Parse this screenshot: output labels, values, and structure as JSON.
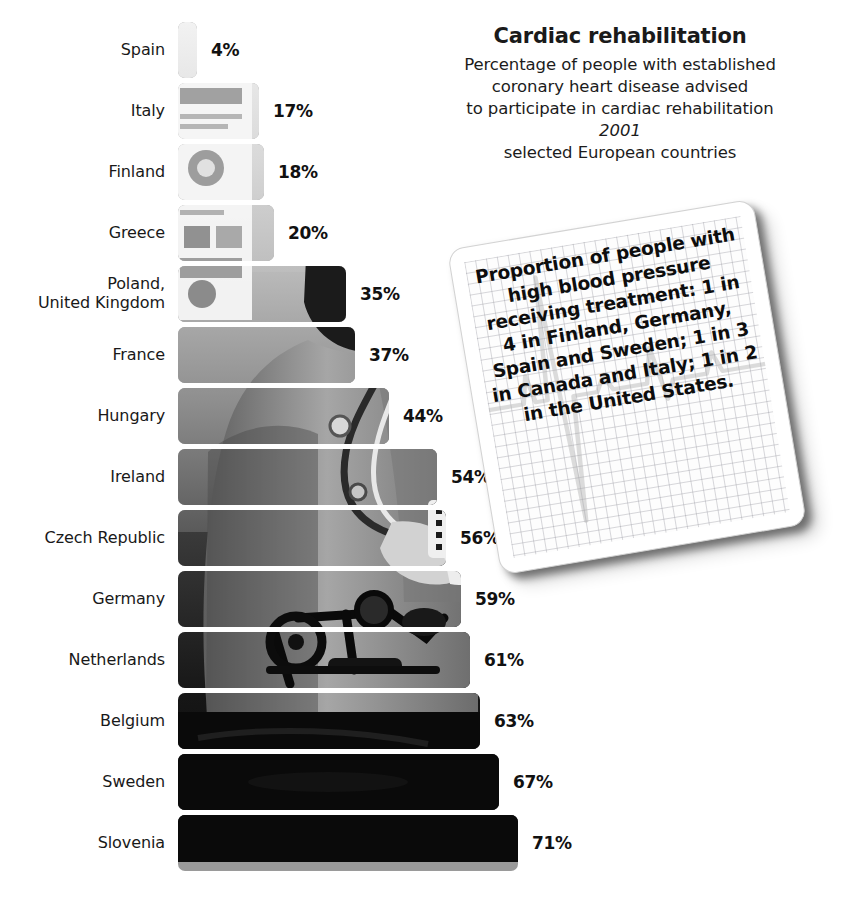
{
  "title": {
    "heading": "Cardiac rehabilitation",
    "subtitle_lines": [
      "Percentage of people with established",
      "coronary heart disease advised",
      "to participate in cardiac rehabilitation"
    ],
    "year": "2001",
    "scope": "selected European countries"
  },
  "note_card": {
    "text": "Proportion of people with high blood pressure receiving treatment: 1 in 4 in Finland, Germany, Spain and Sweden; 1 in 3 in Canada and Italy; 1 in 2 in the United States.",
    "background_icon": "ecg-waveform-icon"
  },
  "chart_data": {
    "type": "bar",
    "orientation": "horizontal",
    "title": "Cardiac rehabilitation",
    "subtitle": "Percentage of people with established coronary heart disease advised to participate in cardiac rehabilitation",
    "year": "2001",
    "scope": "selected European countries",
    "xlabel": "",
    "ylabel": "",
    "xlim": [
      0,
      71
    ],
    "grid": false,
    "legend": false,
    "value_suffix": "%",
    "categories": [
      "Spain",
      "Italy",
      "Finland",
      "Greece",
      "Poland,\nUnited Kingdom",
      "France",
      "Hungary",
      "Ireland",
      "Czech Republic",
      "Germany",
      "Netherlands",
      "Belgium",
      "Sweden",
      "Slovenia"
    ],
    "values": [
      4,
      17,
      18,
      20,
      35,
      37,
      44,
      54,
      56,
      59,
      61,
      63,
      67,
      71
    ],
    "labels": [
      "4%",
      "17%",
      "18%",
      "20%",
      "35%",
      "37%",
      "44%",
      "54%",
      "56%",
      "59%",
      "61%",
      "63%",
      "67%",
      "71%"
    ]
  },
  "rows": [
    {
      "label_lines": [
        "Spain"
      ],
      "value": 4,
      "label": "4%"
    },
    {
      "label_lines": [
        "Italy"
      ],
      "value": 17,
      "label": "17%"
    },
    {
      "label_lines": [
        "Finland"
      ],
      "value": 18,
      "label": "18%"
    },
    {
      "label_lines": [
        "Greece"
      ],
      "value": 20,
      "label": "20%"
    },
    {
      "label_lines": [
        "Poland,",
        "United Kingdom"
      ],
      "value": 35,
      "label": "35%"
    },
    {
      "label_lines": [
        "France"
      ],
      "value": 37,
      "label": "37%"
    },
    {
      "label_lines": [
        "Hungary"
      ],
      "value": 44,
      "label": "44%"
    },
    {
      "label_lines": [
        "Ireland"
      ],
      "value": 54,
      "label": "54%"
    },
    {
      "label_lines": [
        "Czech Republic"
      ],
      "value": 56,
      "label": "56%"
    },
    {
      "label_lines": [
        "Germany"
      ],
      "value": 59,
      "label": "59%"
    },
    {
      "label_lines": [
        "Netherlands"
      ],
      "value": 61,
      "label": "61%"
    },
    {
      "label_lines": [
        "Belgium"
      ],
      "value": 63,
      "label": "63%"
    },
    {
      "label_lines": [
        "Sweden"
      ],
      "value": 67,
      "label": "67%"
    },
    {
      "label_lines": [
        "Slovenia"
      ],
      "value": 71,
      "label": "71%"
    }
  ],
  "colors": {
    "background": "#ffffff",
    "text": "#191919",
    "value_text": "#111111",
    "bar_light": "#a8a8a8",
    "bar_dark": "#141414",
    "note_grid": "#9698a0"
  },
  "layout": {
    "bar_origin_x": 178,
    "row_height": 56,
    "row_gap": 5,
    "first_row_top": 22,
    "px_per_percent": 4.79
  }
}
